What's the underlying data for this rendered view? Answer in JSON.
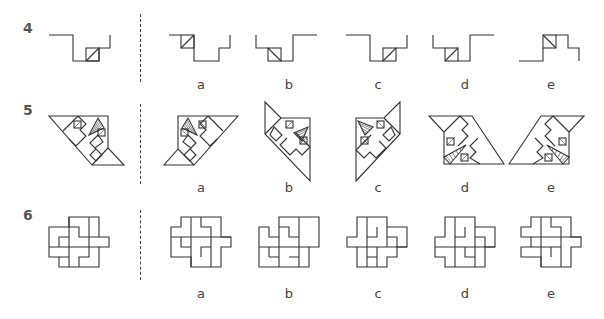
{
  "rows": [
    {
      "number": "4",
      "options": [
        "a",
        "b",
        "c",
        "d",
        "e"
      ]
    },
    {
      "number": "5",
      "options": [
        "a",
        "b",
        "c",
        "d",
        "e"
      ]
    },
    {
      "number": "6",
      "options": [
        "a",
        "b",
        "c",
        "d",
        "e"
      ]
    }
  ],
  "colors": {
    "line": "#333333",
    "label": "#444444",
    "row_number": "#555555"
  }
}
